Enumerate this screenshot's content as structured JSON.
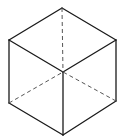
{
  "diagram": {
    "title": "",
    "type": "isometric-cube-wireframe",
    "colors": {
      "background": "#ffffff",
      "solid_edge": "#1a1a1a",
      "hidden_edge": "#555555"
    },
    "vertices": {
      "top": [
        62,
        8
      ],
      "upper_left": [
        9,
        40
      ],
      "upper_right": [
        116,
        40
      ],
      "center": [
        63,
        72
      ],
      "lower_left": [
        9,
        103
      ],
      "lower_right": [
        116,
        101
      ],
      "bottom": [
        63,
        135
      ]
    },
    "solid_edges": [
      [
        "top",
        "upper_left"
      ],
      [
        "top",
        "upper_right"
      ],
      [
        "upper_left",
        "center"
      ],
      [
        "upper_right",
        "center"
      ],
      [
        "upper_left",
        "lower_left"
      ],
      [
        "upper_right",
        "lower_right"
      ],
      [
        "center",
        "bottom"
      ],
      [
        "lower_left",
        "bottom"
      ],
      [
        "lower_right",
        "bottom"
      ]
    ],
    "dashed_edges": [
      [
        "top",
        "center"
      ],
      [
        "lower_left",
        "center"
      ],
      [
        "lower_right",
        "center"
      ]
    ]
  }
}
